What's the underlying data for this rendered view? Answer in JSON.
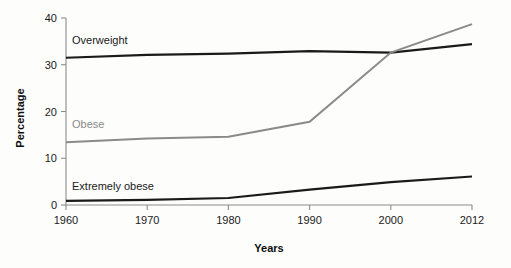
{
  "chart_data": {
    "type": "line",
    "title": "",
    "xlabel": "Years",
    "ylabel": "Percentage",
    "x": [
      1960,
      1970,
      1980,
      1990,
      2000,
      2012
    ],
    "xticklabels": [
      "1960",
      "1970",
      "1980",
      "1990",
      "2000",
      "2012"
    ],
    "yticklabels": [
      "0",
      "10",
      "20",
      "30",
      "40"
    ],
    "yticks": [
      0,
      10,
      20,
      30,
      40
    ],
    "xlim": [
      1960,
      2012
    ],
    "ylim": [
      0,
      40
    ],
    "grid": false,
    "legend_position": "inline-labels",
    "series": [
      {
        "name": "Overweight",
        "color": "#1a1a1a",
        "values": [
          31.5,
          32.1,
          32.4,
          32.9,
          32.6,
          34.4
        ],
        "label_x": 1960,
        "label_y": 34.5
      },
      {
        "name": "Obese",
        "color": "#8a8a8a",
        "values": [
          13.4,
          14.2,
          14.6,
          17.8,
          32.6,
          38.7
        ],
        "label_x": 1960,
        "label_y": 16.5
      },
      {
        "name": "Extremely obese",
        "color": "#1a1a1a",
        "values": [
          0.9,
          1.1,
          1.5,
          3.3,
          4.9,
          6.1
        ],
        "label_x": 1960,
        "label_y": 3.2
      }
    ]
  },
  "axes": {
    "y_axis_title": "Percentage",
    "x_axis_title": "Years"
  },
  "ticks": {
    "y": [
      "0",
      "10",
      "20",
      "30",
      "40"
    ],
    "x": [
      "1960",
      "1970",
      "1980",
      "1990",
      "2000",
      "2012"
    ]
  },
  "labels": {
    "overweight": "Overweight",
    "obese": "Obese",
    "extremely_obese": "Extremely obese"
  }
}
